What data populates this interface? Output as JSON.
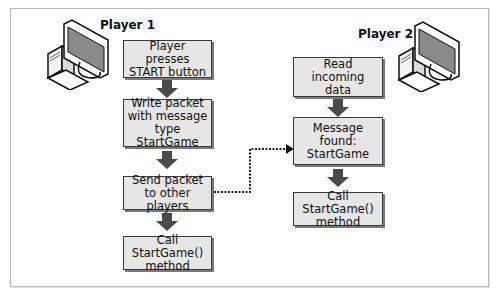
{
  "diagram": {
    "type": "flowchart",
    "colors": {
      "box_fill": "#e6e6e6",
      "box_border": "#3a3a3a",
      "box_shadow": "#7a7a7a",
      "arrow": "#4a4a4a",
      "connector": "#222222",
      "frame": "#b8b8b8"
    },
    "player1": {
      "label": "Player 1",
      "icon": "desktop-computer-icon",
      "steps": [
        {
          "text": "Player presses START button"
        },
        {
          "text": "Write packet with message type StartGame"
        },
        {
          "text": "Send packet to other players"
        },
        {
          "text": "Call StartGame() method"
        }
      ]
    },
    "player2": {
      "label": "Player 2",
      "icon": "desktop-computer-icon",
      "steps": [
        {
          "text": "Read incoming data"
        },
        {
          "text": "Message found: StartGame"
        },
        {
          "text": "Call StartGame() method"
        }
      ]
    },
    "connections": [
      {
        "from": "player1.steps.2",
        "to": "player2.steps.1",
        "style": "dotted"
      }
    ]
  }
}
